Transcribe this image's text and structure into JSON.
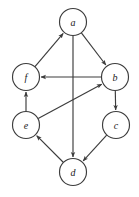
{
  "figure": {
    "width": 139,
    "height": 197,
    "background_color": "#ffffff",
    "stroke_color": "#3c3c3c",
    "node_fill_color": "#ffffff",
    "label_color": "#1a1a1a"
  },
  "chart_data": {
    "type": "diagram",
    "diagram_type": "directed-graph",
    "title": "",
    "node_radius": 13.5,
    "directed": true,
    "nodes": [
      {
        "id": "a",
        "label": "a",
        "x": 73,
        "y": 22
      },
      {
        "id": "f",
        "label": "f",
        "x": 26,
        "y": 77
      },
      {
        "id": "b",
        "label": "b",
        "x": 115,
        "y": 77
      },
      {
        "id": "e",
        "label": "e",
        "x": 26,
        "y": 125
      },
      {
        "id": "c",
        "label": "c",
        "x": 116,
        "y": 125
      },
      {
        "id": "d",
        "label": "d",
        "x": 73,
        "y": 172
      }
    ],
    "edges": [
      {
        "from": "f",
        "to": "a",
        "arrowhead": "at-target"
      },
      {
        "from": "a",
        "to": "b",
        "arrowhead": "at-target"
      },
      {
        "from": "a",
        "to": "d",
        "arrowhead": "at-target"
      },
      {
        "from": "b",
        "to": "f",
        "arrowhead": "at-target"
      },
      {
        "from": "b",
        "to": "c",
        "arrowhead": "at-target"
      },
      {
        "from": "e",
        "to": "f",
        "arrowhead": "at-target"
      },
      {
        "from": "e",
        "to": "b",
        "arrowhead": "at-target"
      },
      {
        "from": "c",
        "to": "d",
        "arrowhead": "at-target"
      },
      {
        "from": "d",
        "to": "e",
        "arrowhead": "at-target"
      }
    ],
    "node_labels": [
      "a",
      "f",
      "b",
      "e",
      "c",
      "d"
    ],
    "edge_list_text": [
      "f->a",
      "a->b",
      "a->d",
      "b->f",
      "b->c",
      "e->f",
      "e->b",
      "c->d",
      "d->e"
    ]
  }
}
